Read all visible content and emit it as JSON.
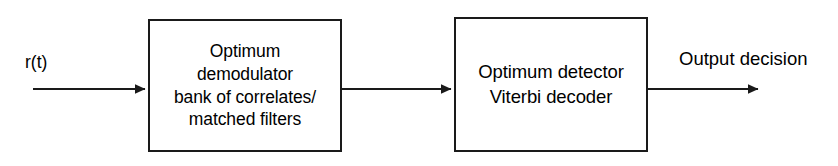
{
  "diagram": {
    "type": "block-diagram",
    "background_color": "#ffffff",
    "line_color": "#1a1a1a",
    "nodes": [
      {
        "id": "demodulator",
        "lines": [
          "Optimum",
          "demodulator",
          "bank of correlates/",
          "matched filters"
        ]
      },
      {
        "id": "detector",
        "lines": [
          "Optimum detector",
          "Viterbi decoder"
        ]
      }
    ],
    "labels": {
      "input": "r(t)",
      "output": "Output decision"
    }
  }
}
